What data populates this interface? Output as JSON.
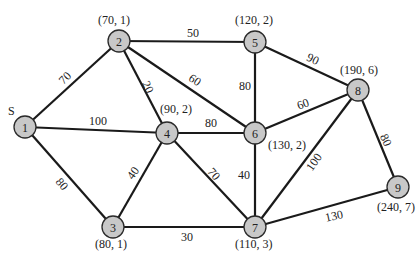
{
  "diagram": {
    "type": "weighted-undirected-graph",
    "caption_fragment": "",
    "source_marker": "S",
    "node_radius": 11,
    "colors": {
      "node_fill": "#c8c8c8",
      "node_stroke": "#2a2a2a",
      "edge": "#1a1a1a",
      "text": "#222222"
    },
    "nodes": [
      {
        "id": "1",
        "label": "1",
        "x": 25,
        "y": 127,
        "pair": "",
        "pair_x": 0,
        "pair_y": 0,
        "is_source": true
      },
      {
        "id": "2",
        "label": "2",
        "x": 119,
        "y": 41,
        "pair": "(70, 1)",
        "pair_x": 98,
        "pair_y": 24,
        "is_source": false
      },
      {
        "id": "3",
        "label": "3",
        "x": 113,
        "y": 227,
        "pair": "(80, 1)",
        "pair_x": 95,
        "pair_y": 248,
        "is_source": false
      },
      {
        "id": "4",
        "label": "4",
        "x": 167,
        "y": 133,
        "pair": "(90, 2)",
        "pair_x": 160,
        "pair_y": 113,
        "is_source": false
      },
      {
        "id": "5",
        "label": "5",
        "x": 255,
        "y": 42,
        "pair": "(120, 2)",
        "pair_x": 235,
        "pair_y": 24,
        "is_source": false
      },
      {
        "id": "6",
        "label": "6",
        "x": 255,
        "y": 133,
        "pair": "(130, 2)",
        "pair_x": 268,
        "pair_y": 149,
        "is_source": false
      },
      {
        "id": "7",
        "label": "7",
        "x": 255,
        "y": 227,
        "pair": "(110, 3)",
        "pair_x": 235,
        "pair_y": 248,
        "is_source": false
      },
      {
        "id": "8",
        "label": "8",
        "x": 358,
        "y": 90,
        "pair": "(190, 6)",
        "pair_x": 340,
        "pair_y": 74,
        "is_source": false
      },
      {
        "id": "9",
        "label": "9",
        "x": 398,
        "y": 187,
        "pair": "(240, 7)",
        "pair_x": 377,
        "pair_y": 211,
        "is_source": false
      }
    ],
    "edges": [
      {
        "from": "1",
        "to": "2",
        "weight": "70",
        "lx": 65,
        "ly": 78,
        "rot": -45
      },
      {
        "from": "1",
        "to": "4",
        "weight": "100",
        "lx": 98,
        "ly": 121,
        "rot": 0
      },
      {
        "from": "1",
        "to": "3",
        "weight": "80",
        "lx": 62,
        "ly": 184,
        "rot": 50
      },
      {
        "from": "2",
        "to": "5",
        "weight": "50",
        "lx": 193,
        "ly": 33,
        "rot": 0
      },
      {
        "from": "2",
        "to": "4",
        "weight": "20",
        "lx": 148,
        "ly": 87,
        "rot": 65
      },
      {
        "from": "2",
        "to": "6",
        "weight": "60",
        "lx": 195,
        "ly": 80,
        "rot": 33
      },
      {
        "from": "4",
        "to": "6",
        "weight": "80",
        "lx": 211,
        "ly": 123,
        "rot": 0
      },
      {
        "from": "4",
        "to": "3",
        "weight": "40",
        "lx": 133,
        "ly": 173,
        "rot": -55
      },
      {
        "from": "4",
        "to": "7",
        "weight": "70",
        "lx": 214,
        "ly": 174,
        "rot": 50
      },
      {
        "from": "3",
        "to": "7",
        "weight": "30",
        "lx": 187,
        "ly": 237,
        "rot": 0
      },
      {
        "from": "5",
        "to": "6",
        "weight": "80",
        "lx": 245,
        "ly": 86,
        "rot": 0
      },
      {
        "from": "5",
        "to": "8",
        "weight": "90",
        "lx": 313,
        "ly": 59,
        "rot": 25
      },
      {
        "from": "6",
        "to": "7",
        "weight": "40",
        "lx": 244,
        "ly": 175,
        "rot": 0
      },
      {
        "from": "6",
        "to": "8",
        "weight": "60",
        "lx": 303,
        "ly": 104,
        "rot": -20
      },
      {
        "from": "7",
        "to": "8",
        "weight": "100",
        "lx": 314,
        "ly": 162,
        "rot": -55
      },
      {
        "from": "7",
        "to": "9",
        "weight": "130",
        "lx": 334,
        "ly": 216,
        "rot": -12
      },
      {
        "from": "8",
        "to": "9",
        "weight": "80",
        "lx": 386,
        "ly": 140,
        "rot": 65
      }
    ]
  }
}
